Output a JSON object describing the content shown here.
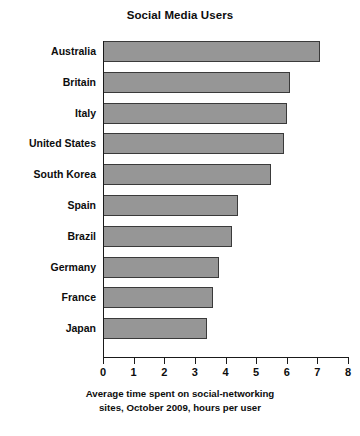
{
  "chart_data": {
    "type": "bar",
    "orientation": "horizontal",
    "title": "Social Media Users",
    "xlabel_line1": "Average time spent on social-networking",
    "xlabel_line2": "sites, October 2009, hours per user",
    "ylabel": "",
    "xlim": [
      0,
      8
    ],
    "xticks": [
      "0",
      "1",
      "2",
      "3",
      "4",
      "5",
      "6",
      "7",
      "8"
    ],
    "grid": false,
    "legend": null,
    "categories": [
      "Australia",
      "Britain",
      "Italy",
      "United States",
      "South Korea",
      "Spain",
      "Brazil",
      "Germany",
      "France",
      "Japan"
    ],
    "values": [
      7.1,
      6.1,
      6.0,
      5.9,
      5.5,
      4.4,
      4.2,
      3.8,
      3.6,
      3.4
    ],
    "bars": [
      {
        "label": "Australia",
        "value": 7.1
      },
      {
        "label": "Britain",
        "value": 6.1
      },
      {
        "label": "Italy",
        "value": 6.0
      },
      {
        "label": "United States",
        "value": 5.9
      },
      {
        "label": "South Korea",
        "value": 5.5
      },
      {
        "label": "Spain",
        "value": 4.4
      },
      {
        "label": "Brazil",
        "value": 4.2
      },
      {
        "label": "Germany",
        "value": 3.8
      },
      {
        "label": "France",
        "value": 3.6
      },
      {
        "label": "Japan",
        "value": 3.4
      }
    ],
    "colors": {
      "bar_fill": "#969696",
      "bar_border": "#3a3a3a",
      "axis": "#1a1a1a",
      "text": "#0d0d0d",
      "background": "#ffffff"
    }
  }
}
